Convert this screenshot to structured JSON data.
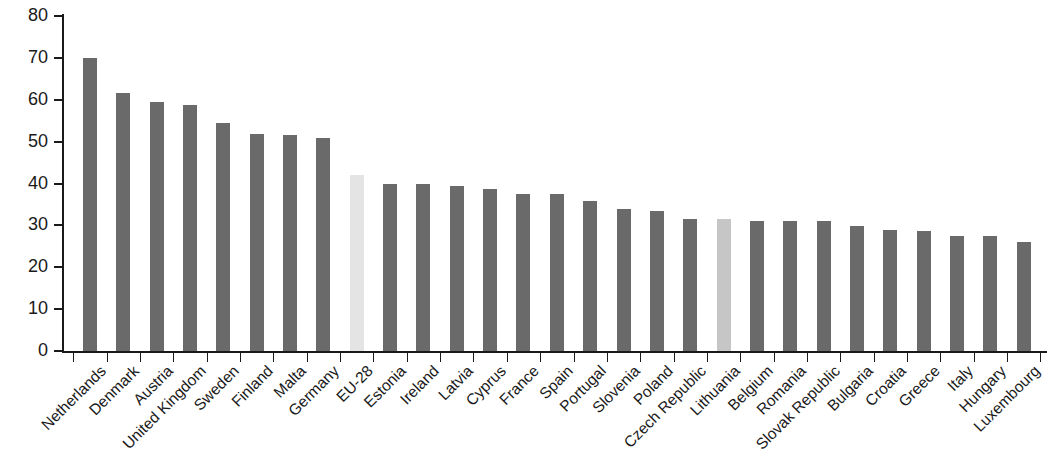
{
  "chart_data": {
    "type": "bar",
    "title": "",
    "subtitle": "",
    "xlabel": "",
    "ylabel": "",
    "ylim": [
      0,
      80
    ],
    "ytick_labels": [
      "80",
      "70",
      "60",
      "50",
      "40",
      "30",
      "20",
      "10",
      "0"
    ],
    "ytick_values": [
      80,
      70,
      60,
      50,
      40,
      30,
      20,
      10,
      0
    ],
    "grid": false,
    "legend": [],
    "legend_position": "none",
    "colors": {
      "bar_default": "#6a6a6a",
      "bar_highlight_eu": "#e4e4e4",
      "bar_highlight_country": "#c6c6c6",
      "axis": "#1a1a1a",
      "background": "#ffffff"
    },
    "categories": [
      "Netherlands",
      "Denmark",
      "Austria",
      "United Kingdom",
      "Sweden",
      "Finland",
      "Malta",
      "Germany",
      "EU-28",
      "Estonia",
      "Ireland",
      "Latvia",
      "Cyprus",
      "France",
      "Spain",
      "Portugal",
      "Slovenia",
      "Poland",
      "Czech Republic",
      "Lithuania",
      "Belgium",
      "Romania",
      "Slovak Republic",
      "Bulgaria",
      "Croatia",
      "Greece",
      "Italy",
      "Hungary",
      "Luxembourg"
    ],
    "values": [
      70.0,
      61.7,
      59.4,
      58.8,
      54.4,
      51.8,
      51.5,
      50.8,
      42.1,
      39.8,
      39.8,
      39.5,
      38.7,
      37.6,
      37.5,
      35.9,
      34.0,
      33.5,
      31.6,
      31.6,
      31.1,
      31.0,
      31.0,
      29.8,
      29.0,
      28.6,
      27.4,
      27.4,
      26.1
    ],
    "highlight_styles": [
      "default",
      "default",
      "default",
      "default",
      "default",
      "default",
      "default",
      "default",
      "eu",
      "default",
      "default",
      "default",
      "default",
      "default",
      "default",
      "default",
      "default",
      "default",
      "default",
      "country",
      "default",
      "default",
      "default",
      "default",
      "default",
      "default",
      "default",
      "default",
      "default"
    ]
  }
}
